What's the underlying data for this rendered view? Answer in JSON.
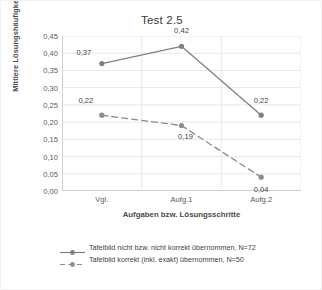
{
  "chart_data": {
    "type": "line",
    "title": "Test 2.5",
    "xlabel": "Aufgaben bzw. Lösungsschritte",
    "ylabel": "Mittlere Lösungshäufigkeit",
    "categories": [
      "Vgl.",
      "Aufg.1",
      "Aufg.2"
    ],
    "ylim": [
      0.0,
      0.45
    ],
    "ytick_labels": [
      "0,45",
      "0,40",
      "0,35",
      "0,30",
      "0,25",
      "0,20",
      "0,15",
      "0,10",
      "0,05",
      "0,00"
    ],
    "ytick_values": [
      0.45,
      0.4,
      0.35,
      0.3,
      0.25,
      0.2,
      0.15,
      0.1,
      0.05,
      0.0
    ],
    "grid": "both",
    "legend_position": "bottom",
    "series": [
      {
        "name": "Tafelbild nicht bzw. nicht korrekt übernommen, N=72",
        "values": [
          0.37,
          0.42,
          0.22
        ],
        "labels": [
          "0,37",
          "0,42",
          "0,22"
        ],
        "style": "solid",
        "color": "#808080",
        "marker": "circle"
      },
      {
        "name": "Tafelbild korrekt (inkl. exakt) übernommen, N=50",
        "values": [
          0.22,
          0.19,
          0.04
        ],
        "labels": [
          "0,22",
          "0,19",
          "0,04"
        ],
        "style": "dashed",
        "color": "#8c8c8c",
        "marker": "circle"
      }
    ]
  },
  "colors": {
    "series1": "#808080",
    "series2": "#8c8c8c",
    "gridline": "#e8e8e8",
    "axis": "#d0d0d0",
    "text": "#4a4a4a",
    "background": "#ffffff"
  }
}
